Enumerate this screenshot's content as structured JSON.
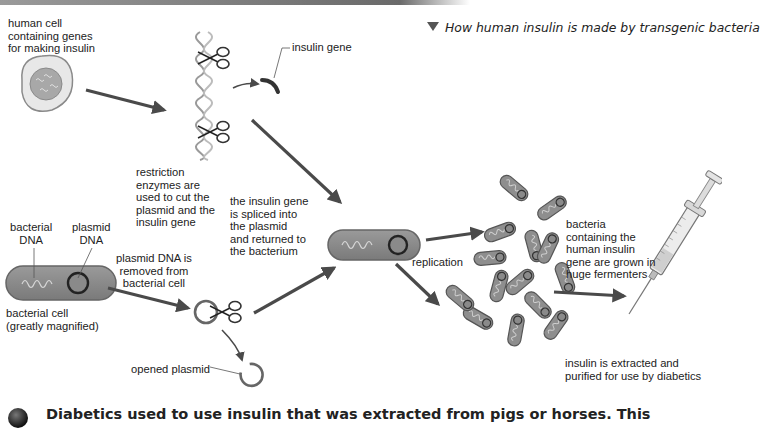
{
  "figure": {
    "caption": "How human insulin is made by transgenic bacteria",
    "colors": {
      "arrow": "#4a4a4a",
      "cell_fill": "#8a8a8a",
      "cell_outline": "#555555",
      "plasmid_ring": "#3a3a3a",
      "human_cell_outer": "#e6e6e6",
      "human_cell_nucleus": "#a8a8a8"
    }
  },
  "labels": {
    "human_cell": "human cell\ncontaining genes\nfor making insulin",
    "insulin_gene": "insulin gene",
    "restriction_enzymes": "restriction\nenzymes are\nused to cut the\nplasmid and the\ninsulin gene",
    "spliced": "the insulin gene\nis spliced into\nthe plasmid\nand returned to\nthe bacterium",
    "bacterial_dna": "bacterial\nDNA",
    "plasmid_dna": "plasmid\nDNA",
    "bacterial_cell": "bacterial cell\n(greatly magnified)",
    "plasmid_removed": "plasmid DNA is\nremoved from\nbacterial cell",
    "opened_plasmid": "opened plasmid",
    "replication": "replication",
    "bacteria_grown": "bacteria\ncontaining the\nhuman insulin\ngene are grown in\nhuge fermenters",
    "insulin_extracted": "insulin is extracted and\npurified for use by diabetics"
  },
  "footer": {
    "text": "Diabetics used to use insulin that was extracted from pigs or horses. This"
  }
}
